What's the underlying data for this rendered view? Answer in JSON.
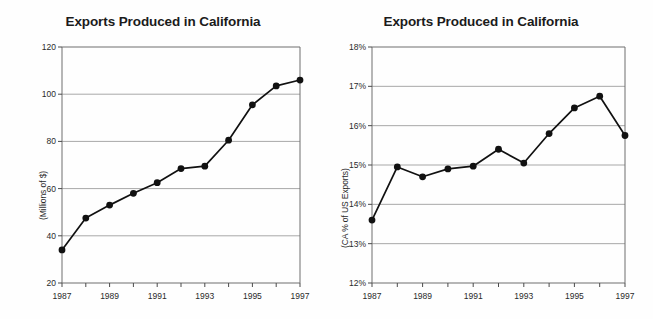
{
  "document": {
    "kind": "scanned-figure",
    "background_color": "#fefefe",
    "ink_color": "#1a1a1a",
    "gridline_color": "#a8a8a8"
  },
  "charts": [
    {
      "id": "exports-millions",
      "title": "Exports Produced in California",
      "ylabel": "(Millions of $)",
      "xlabel": "",
      "ytick_labels": [
        "120",
        "100",
        "80",
        "60",
        "40",
        "20"
      ],
      "xtick_labels": [
        "1987",
        "1989",
        "1991",
        "1993",
        "1995",
        "1997"
      ]
    },
    {
      "id": "exports-percent",
      "title": "Exports Produced in California",
      "ylabel": "(CA % of US Exports)",
      "xlabel": "",
      "ytick_labels": [
        "18%",
        "17%",
        "16%",
        "15%",
        "14%",
        "13%",
        "12%"
      ],
      "xtick_labels": [
        "1987",
        "1989",
        "1991",
        "1993",
        "1995",
        "1997"
      ]
    }
  ],
  "chart_data": [
    {
      "type": "line",
      "title": "Exports Produced in California",
      "xlabel": "",
      "ylabel": "(Millions of $)",
      "x": [
        1987,
        1988,
        1989,
        1990,
        1991,
        1992,
        1993,
        1994,
        1995,
        1996,
        1997
      ],
      "values": [
        34,
        47.5,
        53,
        58,
        62.5,
        68.5,
        69.5,
        80.5,
        95.5,
        103.5,
        106
      ],
      "xlim": [
        1987,
        1997
      ],
      "ylim": [
        20,
        120
      ],
      "yticks": [
        20,
        40,
        60,
        80,
        100,
        120
      ],
      "ytick_labels": [
        "20",
        "40",
        "60",
        "80",
        "100",
        "120"
      ],
      "xticks": [
        1987,
        1988,
        1989,
        1990,
        1991,
        1992,
        1993,
        1994,
        1995,
        1996,
        1997
      ],
      "xtick_labels": [
        "1987",
        "",
        "1989",
        "",
        "1991",
        "",
        "1993",
        "",
        "1995",
        "",
        "1997"
      ],
      "grid": "horizontal",
      "legend": "none",
      "marker": "filled-circle",
      "line_color": "#111111",
      "marker_color": "#111111"
    },
    {
      "type": "line",
      "title": "Exports Produced in California",
      "xlabel": "",
      "ylabel": "(CA % of US Exports)",
      "x": [
        1987,
        1988,
        1989,
        1990,
        1991,
        1992,
        1993,
        1994,
        1995,
        1996,
        1997
      ],
      "values": [
        13.6,
        14.95,
        14.7,
        14.9,
        14.97,
        15.4,
        15.05,
        15.8,
        16.45,
        16.75,
        15.75
      ],
      "xlim": [
        1987,
        1997
      ],
      "ylim": [
        12,
        18
      ],
      "yticks": [
        12,
        13,
        14,
        15,
        16,
        17,
        18
      ],
      "ytick_labels": [
        "12%",
        "13%",
        "14%",
        "15%",
        "16%",
        "17%",
        "18%"
      ],
      "xticks": [
        1987,
        1988,
        1989,
        1990,
        1991,
        1992,
        1993,
        1994,
        1995,
        1996,
        1997
      ],
      "xtick_labels": [
        "1987",
        "",
        "1989",
        "",
        "1991",
        "",
        "1993",
        "",
        "1995",
        "",
        "1997"
      ],
      "grid": "horizontal",
      "legend": "none",
      "marker": "filled-circle",
      "line_color": "#111111",
      "marker_color": "#111111"
    }
  ]
}
